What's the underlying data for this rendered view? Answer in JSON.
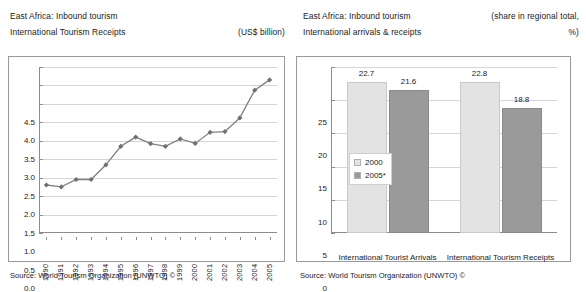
{
  "left_panel": {
    "title_line1": "East Africa: Inbound tourism",
    "title_line2": "International Tourism Receipts",
    "unit": "(US$ billion)",
    "source": "Source: World Tourism Organization (UNWTO) ©"
  },
  "right_panel": {
    "title_line1": "East Africa: Inbound tourism",
    "title_line2": "International arrivals & receipts",
    "unit_line1": "(share in regional total,",
    "unit_line2": "%)",
    "source": "Source: World Tourism Organization (UNWTO) ©"
  },
  "colors": {
    "line": "#808080",
    "marker": "#707070",
    "bar_2000": "#e3e3e3",
    "bar_2005": "#9a9a9a",
    "grid": "#d5d5d5",
    "axis": "#8d8d8d",
    "frame": "#9a9a9a"
  },
  "chart_data": [
    {
      "id": "left-line-chart",
      "type": "line",
      "title": "East Africa: Inbound tourism — International Tourism Receipts",
      "xlabel": "",
      "ylabel": "",
      "yunit": "(US$ billion)",
      "ylim": [
        0.0,
        4.5
      ],
      "ytick_labels": [
        "4.5",
        "4.0",
        "3.5",
        "3.0",
        "2.5",
        "2.0",
        "1.5",
        "1.0",
        "0.5",
        "0.0"
      ],
      "yticks": [
        4.5,
        4.0,
        3.5,
        3.0,
        2.5,
        2.0,
        1.5,
        1.0,
        0.5,
        0.0
      ],
      "grid": true,
      "legend": false,
      "categories": [
        "1990",
        "1991",
        "1992",
        "1993",
        "1994",
        "1995",
        "1996",
        "1997",
        "1998",
        "1999",
        "2000",
        "2001",
        "2002",
        "2003",
        "2004",
        "2005"
      ],
      "values": [
        1.3,
        1.25,
        1.45,
        1.45,
        1.85,
        2.35,
        2.6,
        2.42,
        2.35,
        2.55,
        2.43,
        2.73,
        2.75,
        3.12,
        3.87,
        4.15
      ],
      "marker": "diamond",
      "source": "Source: World Tourism Organization (UNWTO) ©"
    },
    {
      "id": "right-bar-chart",
      "type": "bar",
      "title": "East Africa: Inbound tourism — International arrivals & receipts",
      "xlabel": "",
      "ylabel": "",
      "yunit": "(share in regional total, %)",
      "ylim": [
        0,
        25
      ],
      "ytick_labels": [
        "25",
        "20",
        "15",
        "10",
        "5",
        "0"
      ],
      "yticks": [
        25,
        20,
        15,
        10,
        5,
        0
      ],
      "grid": true,
      "legend": true,
      "legend_position": "inside-left",
      "categories": [
        "International Tourist Arrivals",
        "International Tourism Receipts"
      ],
      "series": [
        {
          "name": "2000",
          "values": [
            22.7,
            22.8
          ]
        },
        {
          "name": "2005*",
          "values": [
            21.6,
            18.8
          ]
        }
      ],
      "data_labels": [
        "22.7",
        "21.6",
        "22.8",
        "18.8"
      ],
      "source": "Source: World Tourism Organization (UNWTO) ©"
    }
  ]
}
